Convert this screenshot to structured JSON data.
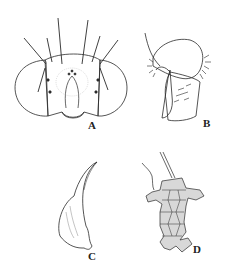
{
  "figure": {
    "panels": [
      {
        "id": "A",
        "label": "A",
        "subject": "head, frontal view"
      },
      {
        "id": "B",
        "label": "B",
        "subject": "terminalia, lateral view"
      },
      {
        "id": "C",
        "label": "C",
        "subject": "sclerite / appendage"
      },
      {
        "id": "D",
        "label": "D",
        "subject": "genitalic structure"
      }
    ],
    "line_color": "#2a2a2a",
    "shade_color": "#d8d8d8"
  }
}
